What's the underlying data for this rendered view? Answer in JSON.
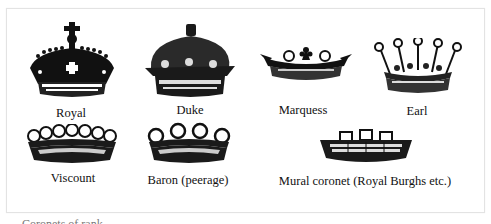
{
  "figure": {
    "crowns": [
      {
        "id": "royal",
        "label": "Royal"
      },
      {
        "id": "duke",
        "label": "Duke"
      },
      {
        "id": "marquess",
        "label": "Marquess"
      },
      {
        "id": "earl",
        "label": "Earl"
      },
      {
        "id": "viscount",
        "label": "Viscount"
      },
      {
        "id": "baron",
        "label": "Baron (peerage)"
      },
      {
        "id": "mural",
        "label": "Mural coronet (Royal Burghs etc.)"
      }
    ],
    "colors": {
      "ink": "#111111",
      "frame": "#e3e3e3",
      "background": "#ffffff"
    }
  },
  "caption": {
    "text": "Coronets of rank"
  }
}
